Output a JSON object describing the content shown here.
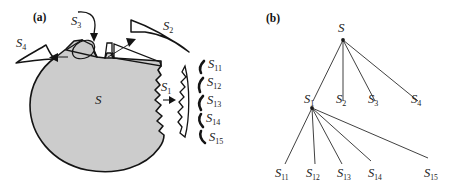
{
  "figure": {
    "panels": [
      {
        "id": "a",
        "tag": "(a)",
        "description": "region decomposition diagram"
      },
      {
        "id": "b",
        "tag": "(b)",
        "description": "hierarchical decomposition tree"
      }
    ],
    "colors": {
      "blob_fill": "#cccccc",
      "blob_stroke": "#141414",
      "line": "#2b2b2b",
      "text": "#1a1a1a",
      "background": "#ffffff"
    }
  },
  "panel_a": {
    "tag": "(a)",
    "blob_label": {
      "base": "S",
      "sub": ""
    },
    "callouts": [
      {
        "name": "s4",
        "base": "S",
        "sub": "4"
      },
      {
        "name": "s3",
        "base": "S",
        "sub": "3"
      },
      {
        "name": "s2",
        "base": "S",
        "sub": "2"
      },
      {
        "name": "s1",
        "base": "S",
        "sub": "1"
      }
    ],
    "slivers": [
      {
        "name": "s11",
        "base": "S",
        "sub": "11"
      },
      {
        "name": "s12",
        "base": "S",
        "sub": "12"
      },
      {
        "name": "s13",
        "base": "S",
        "sub": "13"
      },
      {
        "name": "s14",
        "base": "S",
        "sub": "14"
      },
      {
        "name": "s15",
        "base": "S",
        "sub": "15"
      }
    ]
  },
  "panel_b": {
    "tag": "(b)",
    "root": {
      "base": "S",
      "sub": ""
    },
    "level1": [
      {
        "base": "S",
        "sub": "1"
      },
      {
        "base": "S",
        "sub": "2"
      },
      {
        "base": "S",
        "sub": "3"
      },
      {
        "base": "S",
        "sub": "4"
      }
    ],
    "level2": [
      {
        "base": "S",
        "sub": "11"
      },
      {
        "base": "S",
        "sub": "12"
      },
      {
        "base": "S",
        "sub": "13"
      },
      {
        "base": "S",
        "sub": "14"
      },
      {
        "base": "S",
        "sub": "15"
      }
    ]
  }
}
